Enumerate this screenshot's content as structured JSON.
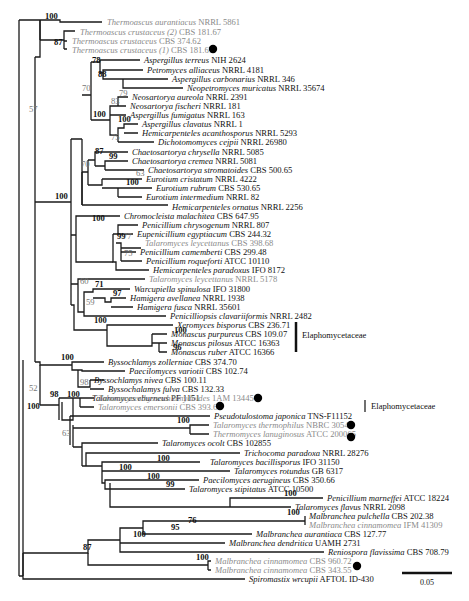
{
  "figure": {
    "type": "phylogenetic-tree",
    "scale_bar": {
      "label": "0.05",
      "x1": 402,
      "x2": 452,
      "y": 573
    },
    "clade_labels": [
      {
        "label": "Elaphomycetaceae",
        "bar_x": 296,
        "y1": 322,
        "y2": 352,
        "text_x": 302,
        "text_y": 338
      },
      {
        "label": "Elaphomycetaceae",
        "bar_x": 365,
        "y1": 400,
        "y2": 412,
        "text_x": 371,
        "text_y": 409
      }
    ],
    "markers": [
      {
        "name": "thermoascus-crustaceus-1-dot",
        "x": 213,
        "y": 49
      },
      {
        "name": "talaromyces-byssochlamydoides-dot",
        "x": 258,
        "y": 398
      },
      {
        "name": "talaromyces-emersonii-dot",
        "x": 220,
        "y": 406
      },
      {
        "name": "talaromyces-thermophilus-dot",
        "x": 351,
        "y": 425
      },
      {
        "name": "thermomyces-lanuginosus-dot",
        "x": 351,
        "y": 437
      },
      {
        "name": "malbranchea-cinnamomea-343-dot",
        "x": 357,
        "y": 566
      }
    ]
  },
  "leaves": [
    {
      "species": "Thermoascus aurantiacus",
      "strain": "NRRL 5861",
      "x": 105,
      "y": 22,
      "color": "gray"
    },
    {
      "species": "Thermoascus crustaceus (2)",
      "strain": "CBS 181.67",
      "x": 78,
      "y": 32,
      "color": "gray"
    },
    {
      "species": "Thermoascus crustaceus",
      "strain": "CBS 374.62",
      "x": 70,
      "y": 41,
      "color": "gray"
    },
    {
      "species": "Thermoascus crustaceus (1)",
      "strain": "CBS 181.67",
      "x": 70,
      "y": 50,
      "color": "gray"
    },
    {
      "species": "Aspergillus terreus",
      "strain": "NIH 2624",
      "x": 142,
      "y": 60,
      "color": "black"
    },
    {
      "species": "Petromyces alliaceus",
      "strain": "NRRL 4181",
      "x": 145,
      "y": 70,
      "color": "black"
    },
    {
      "species": "Aspergillus carbonarius",
      "strain": "NRRL 346",
      "x": 170,
      "y": 79,
      "color": "black"
    },
    {
      "species": "Neopetromyces muricatus",
      "strain": "NRRL 35674",
      "x": 185,
      "y": 88,
      "color": "black"
    },
    {
      "species": "Neosartorya aureola",
      "strain": "NRRL 2391",
      "x": 130,
      "y": 97,
      "color": "black"
    },
    {
      "species": "Neosartorya fischeri",
      "strain": "NRRL 181",
      "x": 128,
      "y": 106,
      "color": "black"
    },
    {
      "species": "Aspergillus fumigatus",
      "strain": "NRRL 163",
      "x": 128,
      "y": 115,
      "color": "black"
    },
    {
      "species": "Aspergillus clavatus",
      "strain": "NRRL 1",
      "x": 140,
      "y": 124,
      "color": "black"
    },
    {
      "species": "Hemicarpenteles acanthosporus",
      "strain": "NRRL 5293",
      "x": 140,
      "y": 133,
      "color": "black"
    },
    {
      "species": "Dichotomomyces cejpii",
      "strain": "NRRL 26980",
      "x": 156,
      "y": 142,
      "color": "black"
    },
    {
      "species": "Chaetosartorya chrysella",
      "strain": "NRRL 5085",
      "x": 130,
      "y": 152,
      "color": "black"
    },
    {
      "species": "Chaetosartorya cremea",
      "strain": "NRRL 5081",
      "x": 130,
      "y": 161,
      "color": "black"
    },
    {
      "species": "Chaetosartorya stromatoides",
      "strain": "CBS 500.65",
      "x": 146,
      "y": 170,
      "color": "black"
    },
    {
      "species": "Eurotium cristatum",
      "strain": "NRRL 4222",
      "x": 144,
      "y": 179,
      "color": "black"
    },
    {
      "species": "Eurotium rubrum",
      "strain": "CBS 530.65",
      "x": 154,
      "y": 188,
      "color": "black"
    },
    {
      "species": "Eurotium intermedium",
      "strain": "NRRL 82",
      "x": 144,
      "y": 197,
      "color": "black"
    },
    {
      "species": "Hemicarpenteles ornatus",
      "strain": "NRRL 2256",
      "x": 170,
      "y": 207,
      "color": "black"
    },
    {
      "species": "Chromocleista malachitea",
      "strain": "CBS 647.95",
      "x": 122,
      "y": 216,
      "color": "black"
    },
    {
      "species": "Penicillium chrysogenum",
      "strain": "NRRL 807",
      "x": 140,
      "y": 225,
      "color": "black"
    },
    {
      "species": "Eupenicillium egyptiacum",
      "strain": "CBS 244.32",
      "x": 135,
      "y": 234,
      "color": "black"
    },
    {
      "species": "Talaromyces leycettanus",
      "strain": "CBS 398.68",
      "x": 143,
      "y": 243,
      "color": "gray"
    },
    {
      "species": "Penicillium camemberti",
      "strain": "CBS 299.48",
      "x": 138,
      "y": 252,
      "color": "black"
    },
    {
      "species": "Penicillium roqueforti",
      "strain": "ATCC 10110",
      "x": 144,
      "y": 261,
      "color": "black"
    },
    {
      "species": "Hemicarpenteles paradoxus",
      "strain": "IFO 8172",
      "x": 151,
      "y": 270,
      "color": "black"
    },
    {
      "species": "Talaromyces leycettanus",
      "strain": "NRRL 5178",
      "x": 147,
      "y": 279,
      "color": "gray"
    },
    {
      "species": "Warcupiella spinulosa",
      "strain": "IFO 31800",
      "x": 132,
      "y": 289,
      "color": "black"
    },
    {
      "species": "Hamigera avellanea",
      "strain": "NRRL 1938",
      "x": 128,
      "y": 298,
      "color": "black"
    },
    {
      "species": "Hamigera fusca",
      "strain": "NRRL 35601",
      "x": 135,
      "y": 307,
      "color": "black"
    },
    {
      "species": "Penicilliopsis clavariiformis",
      "strain": "NRRL 2482",
      "x": 168,
      "y": 316,
      "color": "black"
    },
    {
      "species": "Xeromyces bisporus",
      "strain": "CBS 236.71",
      "x": 175,
      "y": 325,
      "color": "black"
    },
    {
      "species": "Monascus purpureus",
      "strain": "CBS 109.07",
      "x": 169,
      "y": 334,
      "color": "black"
    },
    {
      "species": "Monascus pilosus",
      "strain": "ATCC 16363",
      "x": 169,
      "y": 343,
      "color": "black"
    },
    {
      "species": "Monascus ruber",
      "strain": "ATCC 16366",
      "x": 169,
      "y": 352,
      "color": "black"
    },
    {
      "species": "Byssochlamys zollerniae",
      "strain": "CBS 374.70",
      "x": 106,
      "y": 362,
      "color": "black"
    },
    {
      "species": "Paecilomyces variotii",
      "strain": "CBS 102.74",
      "x": 127,
      "y": 371,
      "color": "black"
    },
    {
      "species": "Byssochlamys nivea",
      "strain": "CBS 100.11",
      "x": 92,
      "y": 380,
      "color": "black"
    },
    {
      "species": "Byssochalamys fulva",
      "strain": "CBS 132.33",
      "x": 106,
      "y": 389,
      "color": "black"
    },
    {
      "species": "Talaromyces eburneus",
      "strain": "PF 1151",
      "x": 90,
      "y": 398,
      "color": "black"
    },
    {
      "species": "Talaromyces byssochlamydoides",
      "strain": "1AM 13445",
      "x": 96,
      "y": 398,
      "color": "gray",
      "row": 407
    },
    {
      "species": "Talaromyces emersonii",
      "strain": "CBS 393.64",
      "x": 96,
      "y": 407,
      "color": "gray"
    },
    {
      "species": "Pseudotulostoma japonica",
      "strain": "TNS-F11152",
      "x": 212,
      "y": 416,
      "color": "black"
    },
    {
      "species": "Talaromyces thermophilus",
      "strain": "NBRC 30541",
      "x": 211,
      "y": 425,
      "color": "gray"
    },
    {
      "species": "Thermomyces lanuginosus",
      "strain": "ATCC 200065",
      "x": 211,
      "y": 434,
      "color": "gray"
    },
    {
      "species": "Talaromyces ocolt",
      "strain": "CBS 102855",
      "x": 160,
      "y": 443,
      "color": "black"
    },
    {
      "species": "Trichocoma  paradoxa",
      "strain": "NRRL 28276",
      "x": 242,
      "y": 453,
      "color": "black"
    },
    {
      "species": "Talaromyces bacillisporus",
      "strain": "IFO 31150",
      "x": 208,
      "y": 462,
      "color": "black"
    },
    {
      "species": "Talaromyces rotundus",
      "strain": "GB 6317",
      "x": 232,
      "y": 471,
      "color": "black"
    },
    {
      "species": "Paecilomyces aerugineus",
      "strain": "CBS 350.66",
      "x": 201,
      "y": 480,
      "color": "black"
    },
    {
      "species": "Talaromyces stipitatus",
      "strain": "ATCC 10500",
      "x": 187,
      "y": 489,
      "color": "black"
    },
    {
      "species": "Penicillium marneffei",
      "strain": "ATCC 18224",
      "x": 325,
      "y": 498,
      "color": "black"
    },
    {
      "species": "Talaromyces flavus",
      "strain": "NRRL 2098",
      "x": 293,
      "y": 507,
      "color": "black"
    },
    {
      "species": "Malbranchea pulchella",
      "strain": "CBS 202.38",
      "x": 307,
      "y": 516,
      "color": "black"
    },
    {
      "species": "Malbranchea cinnamomea",
      "strain": "IFM 41309",
      "x": 307,
      "y": 525,
      "color": "gray"
    },
    {
      "species": "Malbranchea aurantiaca",
      "strain": "CBS 127.77",
      "x": 254,
      "y": 534,
      "color": "black"
    },
    {
      "species": "Malbranchea dendritica",
      "strain": "UAMH 2731",
      "x": 227,
      "y": 543,
      "color": "black"
    },
    {
      "species": "Reniospora flavissima",
      "strain": "CBS 708.79",
      "x": 326,
      "y": 552,
      "color": "black"
    },
    {
      "species": "Malbranchea cinnamomea",
      "strain": "CBS 960.72",
      "x": 213,
      "y": 561,
      "color": "gray"
    },
    {
      "species": "Malbranchea cinnamomea",
      "strain": "CBS 343.55",
      "x": 213,
      "y": 570,
      "color": "gray"
    },
    {
      "species": "Spiromastix wrcupii",
      "strain": "AFTOL ID-430",
      "x": 247,
      "y": 579,
      "color": "black"
    }
  ],
  "support_values": [
    {
      "value": "100",
      "x": 45,
      "y": 19,
      "style": "bold"
    },
    {
      "value": "87",
      "x": 54,
      "y": 45,
      "style": "bold"
    },
    {
      "value": "57",
      "x": 29,
      "y": 112,
      "style": "gray"
    },
    {
      "value": "78",
      "x": 92,
      "y": 63,
      "style": "bold"
    },
    {
      "value": "88",
      "x": 98,
      "y": 77,
      "style": "bold"
    },
    {
      "value": "70",
      "x": 82,
      "y": 91,
      "style": "gray"
    },
    {
      "value": "79",
      "x": 119,
      "y": 96,
      "style": "gray"
    },
    {
      "value": "83",
      "x": 111,
      "y": 104,
      "style": "gray"
    },
    {
      "value": "100",
      "x": 93,
      "y": 117,
      "style": "bold"
    },
    {
      "value": "100",
      "x": 118,
      "y": 122,
      "style": "bold"
    },
    {
      "value": "75",
      "x": 111,
      "y": 140,
      "style": "gray"
    },
    {
      "value": "87",
      "x": 95,
      "y": 154,
      "style": "bold"
    },
    {
      "value": "99",
      "x": 109,
      "y": 159,
      "style": "bold"
    },
    {
      "value": "70",
      "x": 81,
      "y": 167,
      "style": "gray"
    },
    {
      "value": "63",
      "x": 136,
      "y": 176,
      "style": "gray"
    },
    {
      "value": "100",
      "x": 126,
      "y": 185,
      "style": "bold"
    },
    {
      "value": "100",
      "x": 55,
      "y": 199,
      "style": "bold"
    },
    {
      "value": "100",
      "x": 92,
      "y": 221,
      "style": "bold"
    },
    {
      "value": "99",
      "x": 117,
      "y": 239,
      "style": "bold"
    },
    {
      "value": "77",
      "x": 123,
      "y": 239,
      "style": "gray"
    },
    {
      "value": "75",
      "x": 124,
      "y": 256,
      "style": "gray"
    },
    {
      "value": "60",
      "x": 80,
      "y": 284,
      "style": "gray"
    },
    {
      "value": "71",
      "x": 95,
      "y": 287,
      "style": "bold"
    },
    {
      "value": "97",
      "x": 113,
      "y": 296,
      "style": "bold"
    },
    {
      "value": "59",
      "x": 86,
      "y": 305,
      "style": "gray"
    },
    {
      "value": "100",
      "x": 94,
      "y": 323,
      "style": "bold"
    },
    {
      "value": "100",
      "x": 174,
      "y": 333,
      "style": "bold"
    },
    {
      "value": "96",
      "x": 173,
      "y": 350,
      "style": "bold"
    },
    {
      "value": "100",
      "x": 61,
      "y": 360,
      "style": "bold"
    },
    {
      "value": "98",
      "x": 80,
      "y": 385,
      "style": "gray"
    },
    {
      "value": "52",
      "x": 29,
      "y": 391,
      "style": "gray"
    },
    {
      "value": "98",
      "x": 50,
      "y": 397,
      "style": "bold"
    },
    {
      "value": "100",
      "x": 67,
      "y": 397,
      "style": "bold"
    },
    {
      "value": "100",
      "x": 27,
      "y": 409,
      "style": "bold"
    },
    {
      "value": "63",
      "x": 62,
      "y": 436,
      "style": "gray"
    },
    {
      "value": "100",
      "x": 177,
      "y": 423,
      "style": "bold"
    },
    {
      "value": "100",
      "x": 157,
      "y": 461,
      "style": "bold"
    },
    {
      "value": "100",
      "x": 119,
      "y": 470,
      "style": "bold"
    },
    {
      "value": "100",
      "x": 147,
      "y": 479,
      "style": "bold"
    },
    {
      "value": "99",
      "x": 166,
      "y": 487,
      "style": "bold"
    },
    {
      "value": "100",
      "x": 284,
      "y": 496,
      "style": "bold"
    },
    {
      "value": "100",
      "x": 287,
      "y": 515,
      "style": "bold"
    },
    {
      "value": "76",
      "x": 188,
      "y": 523,
      "style": "bold"
    },
    {
      "value": "95",
      "x": 171,
      "y": 530,
      "style": "bold"
    },
    {
      "value": "100",
      "x": 133,
      "y": 537,
      "style": "bold"
    },
    {
      "value": "87",
      "x": 83,
      "y": 550,
      "style": "bold"
    },
    {
      "value": "100",
      "x": 196,
      "y": 560,
      "style": "bold"
    }
  ]
}
